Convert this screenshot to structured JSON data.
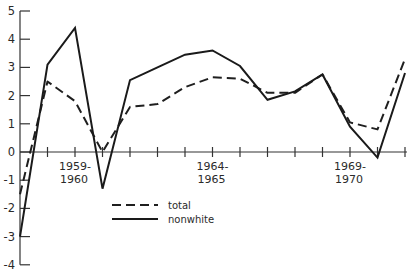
{
  "chart_data": {
    "type": "line",
    "title": "",
    "xlabel": "",
    "ylabel": "",
    "ylim": [
      -4,
      5
    ],
    "yticks": [
      5,
      4,
      3,
      2,
      1,
      0,
      -1,
      -2,
      -3,
      -4
    ],
    "grid": false,
    "legend_position": "lower center (inside plot)",
    "x": [
      "1957-1958",
      "1958-1959",
      "1959-1960",
      "1960-1961",
      "1961-1962",
      "1962-1963",
      "1963-1964",
      "1964-1965",
      "1965-1966",
      "1966-1967",
      "1967-1968",
      "1968-1969",
      "1969-1970",
      "1970-1971",
      "1971-1972"
    ],
    "x_tick_labels": [
      {
        "index": 2,
        "line1": "1959-",
        "line2": "1960"
      },
      {
        "index": 7,
        "line1": "1964-",
        "line2": "1965"
      },
      {
        "index": 12,
        "line1": "1969-",
        "line2": "1970"
      }
    ],
    "series": [
      {
        "name": "total",
        "style": "dashed",
        "values": [
          -1.5,
          2.5,
          1.8,
          0.0,
          1.6,
          1.7,
          2.3,
          2.65,
          2.6,
          2.1,
          2.1,
          2.75,
          1.05,
          0.8,
          3.3
        ]
      },
      {
        "name": "nonwhite",
        "style": "solid",
        "values": [
          -3.0,
          3.1,
          4.4,
          -1.3,
          2.55,
          3.0,
          3.45,
          3.6,
          3.05,
          1.85,
          2.15,
          2.75,
          0.9,
          -0.2,
          2.8
        ]
      }
    ]
  },
  "legend": {
    "total_label": "total",
    "nonwhite_label": "nonwhite"
  },
  "layout": {
    "x0": 20,
    "dx": 27.5,
    "y_zero": 152,
    "y_unit": 28.2
  }
}
